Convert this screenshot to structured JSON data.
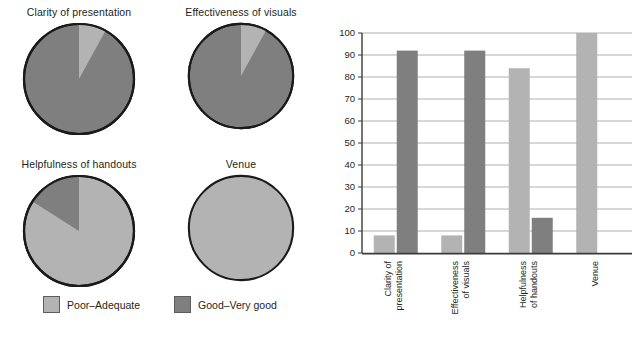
{
  "chart_data": [
    {
      "type": "pie",
      "title": "Clarity of presentation",
      "labels": [
        "Poor–Adequate",
        "Good–Very good"
      ],
      "values": [
        8,
        92
      ]
    },
    {
      "type": "pie",
      "title": "Effectiveness of visuals",
      "labels": [
        "Poor–Adequate",
        "Good–Very good"
      ],
      "values": [
        8,
        92
      ]
    },
    {
      "type": "pie",
      "title": "Helpfulness of handouts",
      "labels": [
        "Poor–Adequate",
        "Good–Very good"
      ],
      "values": [
        84,
        16
      ]
    },
    {
      "type": "pie",
      "title": "Venue",
      "labels": [
        "Poor–Adequate",
        "Good–Very good"
      ],
      "values": [
        100,
        0
      ]
    },
    {
      "type": "bar",
      "title": "",
      "xlabel": "",
      "ylabel": "Percentage",
      "categories": [
        "Clarity of\npresentation",
        "Effectiveness\nof visuals",
        "Helpfulness\nof handouts",
        "Venue"
      ],
      "series": [
        {
          "name": "Poor–Adequate",
          "values": [
            8,
            8,
            84,
            100
          ]
        },
        {
          "name": "Good–Very good",
          "values": [
            92,
            92,
            16,
            0
          ]
        }
      ],
      "ylim": [
        0,
        100
      ],
      "yticks": [
        0,
        10,
        20,
        30,
        40,
        50,
        60,
        70,
        80,
        90,
        100
      ],
      "grid": true,
      "legend_position": "external-left-panel"
    }
  ],
  "legend": {
    "entries": [
      {
        "label": "Poor–Adequate",
        "color": "#b3b3b3"
      },
      {
        "label": "Good–Very good",
        "color": "#7f7f7f"
      }
    ]
  },
  "colors": {
    "light": "#b3b3b3",
    "dark": "#7f7f7f",
    "outline": "#1a1a1a",
    "grid": "#9a9a9a",
    "axis": "#3b3b3b",
    "text": "#231f20"
  },
  "pies": [
    {
      "title": "Clarity of presentation",
      "light_pct": 8,
      "dark_pct": 92
    },
    {
      "title": "Effectiveness of visuals",
      "light_pct": 8,
      "dark_pct": 92
    },
    {
      "title": "Helpfulness of handouts",
      "light_pct": 84,
      "dark_pct": 16
    },
    {
      "title": "Venue",
      "light_pct": 100,
      "dark_pct": 0
    }
  ],
  "bar_chart": {
    "ylabel": "Percentage",
    "yticks": [
      "0",
      "10",
      "20",
      "30",
      "40",
      "50",
      "60",
      "70",
      "80",
      "90",
      "100"
    ],
    "categories": [
      {
        "line1": "Clarity of",
        "line2": "presentation"
      },
      {
        "line1": "Effectiveness",
        "line2": "of visuals"
      },
      {
        "line1": "Helpfulness",
        "line2": "of handouts"
      },
      {
        "line1": "Venue",
        "line2": ""
      }
    ],
    "bars": [
      {
        "category": "Clarity of presentation",
        "light": 8,
        "dark": 92
      },
      {
        "category": "Effectiveness of visuals",
        "light": 8,
        "dark": 92
      },
      {
        "category": "Helpfulness of handouts",
        "light": 84,
        "dark": 16
      },
      {
        "category": "Venue",
        "light": 100,
        "dark": 0
      }
    ]
  }
}
